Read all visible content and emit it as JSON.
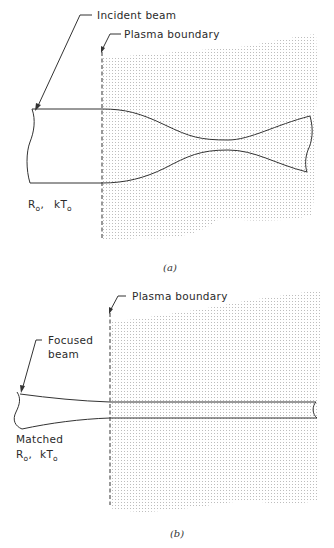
{
  "figure": {
    "panels": [
      {
        "id": "a",
        "caption": "(a)",
        "labels": {
          "incident_beam": "Incident beam",
          "plasma_boundary": "Plasma boundary",
          "radius_symbol": "R",
          "radius_sub": "o",
          "separator": ",",
          "temp_symbol": "kT",
          "temp_sub": "o"
        },
        "description": "Unmatched beam entering plasma, envelope oscillating (necking)"
      },
      {
        "id": "b",
        "caption": "(b)",
        "labels": {
          "focused_beam_line1": "Focused",
          "focused_beam_line2": "beam",
          "plasma_boundary": "Plasma boundary",
          "matched": "Matched",
          "radius_symbol": "R",
          "radius_sub": "o",
          "separator": ",",
          "temp_symbol": "kT",
          "temp_sub": "o"
        },
        "description": "Matched focused beam propagating with constant radius in plasma"
      }
    ],
    "colors": {
      "line": "#333333",
      "plasma_stipple": "#b8b8b8",
      "background": "#ffffff"
    }
  }
}
